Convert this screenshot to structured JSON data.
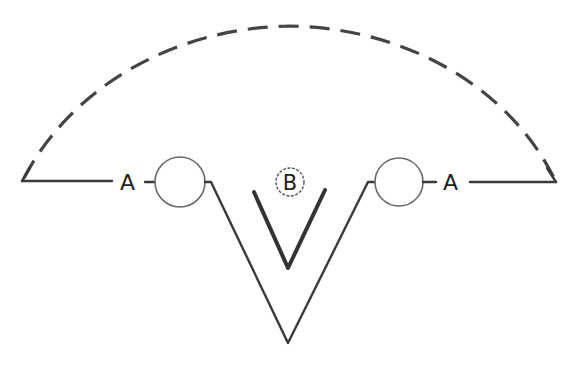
{
  "diagram": {
    "labels": {
      "left_terminal": "A",
      "right_terminal": "A",
      "center_marker": "B"
    },
    "elements": [
      {
        "id": "dashed-arc",
        "description": "Dashed semicircular arc connecting left and right ends"
      },
      {
        "id": "left-baseline",
        "description": "Horizontal line from left end to label A"
      },
      {
        "id": "left-circle",
        "description": "Open circle node on left"
      },
      {
        "id": "outer-v",
        "description": "Large V shape between the two circles"
      },
      {
        "id": "inner-v",
        "description": "Smaller, thicker V inside outer V"
      },
      {
        "id": "right-circle",
        "description": "Open circle node on right"
      },
      {
        "id": "right-baseline",
        "description": "Horizontal line from label A to right end"
      }
    ],
    "colors": {
      "line": "#3a3a3a",
      "circle_stroke": "#6a6a6a",
      "background": "#ffffff"
    }
  }
}
